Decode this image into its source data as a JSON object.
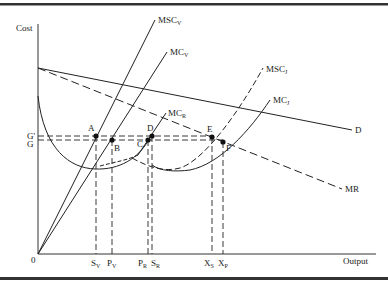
{
  "figure": {
    "type": "economics-cost-output-diagram",
    "axes": {
      "y_label": "Cost",
      "x_label": "Output",
      "origin_label": "0"
    },
    "price_levels": [
      {
        "id": "G_prime",
        "label": "G'",
        "y": 136
      },
      {
        "id": "G",
        "label": "G",
        "y": 140
      }
    ],
    "curves": [
      {
        "id": "MSC_V",
        "main": "MSC",
        "sub": "V",
        "style": "solid"
      },
      {
        "id": "MC_V",
        "main": "MC",
        "sub": "V",
        "style": "solid"
      },
      {
        "id": "MC_R",
        "main": "MC",
        "sub": "R",
        "style": "solid"
      },
      {
        "id": "MSC_J",
        "main": "MSC",
        "sub": "J",
        "style": "dashed"
      },
      {
        "id": "MC_J",
        "main": "MC",
        "sub": "J",
        "style": "solid"
      },
      {
        "id": "D",
        "main": "D",
        "sub": "",
        "style": "solid"
      },
      {
        "id": "MR",
        "main": "MR",
        "sub": "",
        "style": "dashed"
      }
    ],
    "points": [
      {
        "label": "A"
      },
      {
        "label": "B"
      },
      {
        "label": "C"
      },
      {
        "label": "D"
      },
      {
        "label": "E"
      },
      {
        "label": "F"
      }
    ],
    "x_ticks": [
      {
        "main": "S",
        "sub": "V"
      },
      {
        "main": "P",
        "sub": "V"
      },
      {
        "main": "P",
        "sub": "R"
      },
      {
        "main": "S",
        "sub": "R"
      },
      {
        "main": "X",
        "sub": "S"
      },
      {
        "main": "X",
        "sub": "P"
      }
    ]
  }
}
